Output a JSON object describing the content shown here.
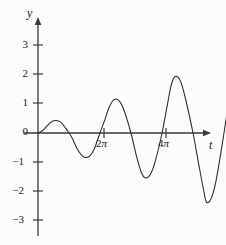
{
  "chart_data": {
    "type": "line",
    "title": "",
    "subtitle": "",
    "xlabel": "t",
    "ylabel": "y",
    "grid": false,
    "legend": false,
    "xlim": [
      0,
      17.8
    ],
    "ylim": [
      -3.6,
      3.8
    ],
    "x_ticks": [
      {
        "value": 6.2832,
        "label": "2π",
        "label_parts": {
          "number": "2",
          "symbol": "π"
        }
      },
      {
        "value": 12.5664,
        "label": "4π",
        "label_parts": {
          "number": "4",
          "symbol": "π"
        }
      }
    ],
    "y_ticks": [
      {
        "value": 3,
        "label": "3"
      },
      {
        "value": 2,
        "label": "2"
      },
      {
        "value": 1,
        "label": "1"
      },
      {
        "value": 0,
        "label": "0"
      },
      {
        "value": -1,
        "label": "−1"
      },
      {
        "value": -2,
        "label": "−2"
      },
      {
        "value": -3,
        "label": "−3"
      }
    ],
    "series": [
      {
        "name": "y(t)",
        "color": "#2a2a2a",
        "extrema": [
          {
            "t": 1.6,
            "y": 0.42,
            "kind": "max"
          },
          {
            "t": 4.6,
            "y": -0.82,
            "kind": "min"
          },
          {
            "t": 7.7,
            "y": 1.15,
            "kind": "max"
          },
          {
            "t": 10.9,
            "y": -1.55,
            "kind": "min"
          },
          {
            "t": 13.9,
            "y": 1.95,
            "kind": "max"
          },
          {
            "t": 17.1,
            "y": -2.4,
            "kind": "min"
          },
          {
            "t": 20.2,
            "y": 2.7,
            "kind": "max"
          },
          {
            "t": 23.3,
            "y": -3.2,
            "kind": "min"
          },
          {
            "t": 26.4,
            "y": 3.45,
            "kind": "max"
          }
        ],
        "zero_crossings": [
          0,
          3.15,
          6.28,
          9.42,
          12.57,
          15.71,
          18.85,
          21.99,
          25.13
        ],
        "end_point": {
          "t": 27.8,
          "y": 1.4
        }
      }
    ],
    "curve_points": [
      [
        0,
        0.0
      ],
      [
        0.4,
        0.07
      ],
      [
        0.8,
        0.2
      ],
      [
        1.2,
        0.34
      ],
      [
        1.6,
        0.42
      ],
      [
        2.0,
        0.42
      ],
      [
        2.4,
        0.34
      ],
      [
        2.8,
        0.17
      ],
      [
        3.15,
        0.0
      ],
      [
        3.5,
        -0.2
      ],
      [
        4.0,
        -0.56
      ],
      [
        4.6,
        -0.82
      ],
      [
        5.2,
        -0.8
      ],
      [
        5.7,
        -0.55
      ],
      [
        6.28,
        0.0
      ],
      [
        6.8,
        0.48
      ],
      [
        7.2,
        0.88
      ],
      [
        7.7,
        1.15
      ],
      [
        8.2,
        1.12
      ],
      [
        8.7,
        0.8
      ],
      [
        9.42,
        0.0
      ],
      [
        10.0,
        -0.82
      ],
      [
        10.5,
        -1.38
      ],
      [
        10.9,
        -1.55
      ],
      [
        11.4,
        -1.42
      ],
      [
        11.9,
        -0.95
      ],
      [
        12.57,
        0.0
      ],
      [
        13.1,
        0.95
      ],
      [
        13.5,
        1.65
      ],
      [
        13.9,
        1.95
      ],
      [
        14.4,
        1.82
      ],
      [
        14.9,
        1.25
      ],
      [
        15.71,
        0.0
      ],
      [
        16.3,
        -1.1
      ],
      [
        16.8,
        -2.0
      ],
      [
        17.1,
        -2.4
      ],
      [
        17.6,
        -2.22
      ],
      [
        18.1,
        -1.55
      ],
      [
        18.85,
        0.0
      ],
      [
        19.4,
        1.25
      ],
      [
        19.9,
        2.32
      ],
      [
        20.2,
        2.7
      ],
      [
        20.7,
        2.55
      ],
      [
        21.2,
        1.85
      ],
      [
        21.99,
        0.0
      ],
      [
        22.5,
        -1.4
      ],
      [
        23.0,
        -2.72
      ],
      [
        23.3,
        -3.2
      ],
      [
        23.8,
        -3.05
      ],
      [
        24.3,
        -2.2
      ],
      [
        25.13,
        0.0
      ],
      [
        25.7,
        1.6
      ],
      [
        26.1,
        2.95
      ],
      [
        26.4,
        3.45
      ],
      [
        26.9,
        3.25
      ],
      [
        27.3,
        2.55
      ],
      [
        27.8,
        1.4
      ]
    ]
  },
  "axis_labels": {
    "y": "y",
    "t": "t"
  },
  "colors": {
    "curve": "#2a2a2a",
    "axis": "#3b3b3b",
    "text": "#1b1b1b",
    "background": "#fcfcfa"
  }
}
